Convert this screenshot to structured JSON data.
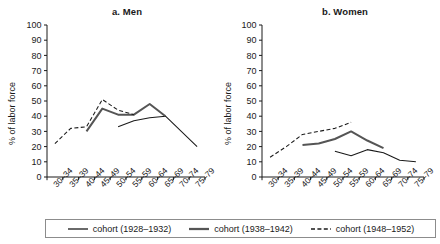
{
  "figure": {
    "ylabel": "% of labor force",
    "y_ticks": [
      "0",
      "10",
      "20",
      "30",
      "40",
      "50",
      "60",
      "70",
      "80",
      "90",
      "100"
    ],
    "x_ticks": [
      "30–34",
      "35–39",
      "40–44",
      "45–49",
      "50–54",
      "55–59",
      "60–64",
      "65–69",
      "70–74",
      "75–79"
    ],
    "panel_a_title": "a. Men",
    "panel_b_title": "b. Women",
    "colors": {
      "cohort_1928_1932": "#1a1a1a",
      "cohort_1938_1942": "#555555",
      "cohort_1948_1952": "#1a1a1a",
      "axis": "#1a1a1a",
      "legend_border": "#8c8c8c"
    },
    "legend": [
      {
        "label": "cohort (1928–1932)",
        "style": "solid-thin",
        "name": "legend-cohort-1928-1932"
      },
      {
        "label": "cohort (1938–1942)",
        "style": "solid-thick",
        "name": "legend-cohort-1938-1942"
      },
      {
        "label": "cohort (1948–1952)",
        "style": "dashed",
        "name": "legend-cohort-1948-1952"
      }
    ]
  },
  "chart_data": [
    {
      "type": "line",
      "title": "a. Men",
      "xlabel": "",
      "ylabel": "% of labor force",
      "ylim": [
        0,
        100
      ],
      "ytick_step": 10,
      "grid": false,
      "legend_position": "bottom",
      "categories": [
        "30–34",
        "35–39",
        "40–44",
        "45–49",
        "50–54",
        "55–59",
        "60–64",
        "65–69",
        "70–74",
        "75–79"
      ],
      "series": [
        {
          "name": "cohort (1928–1932)",
          "style": "solid-thin",
          "values": [
            null,
            null,
            null,
            null,
            33,
            37,
            39,
            40,
            30,
            20
          ]
        },
        {
          "name": "cohort (1938–1942)",
          "style": "solid-thick",
          "values": [
            null,
            null,
            30,
            45,
            41,
            41,
            48,
            40,
            null,
            null
          ]
        },
        {
          "name": "cohort (1948–1952)",
          "style": "dashed",
          "values": [
            22,
            32,
            33,
            51,
            44,
            41,
            null,
            null,
            null,
            null
          ]
        }
      ]
    },
    {
      "type": "line",
      "title": "b. Women",
      "xlabel": "",
      "ylabel": "% of labor force",
      "ylim": [
        0,
        100
      ],
      "ytick_step": 10,
      "grid": false,
      "legend_position": "bottom",
      "categories": [
        "30–34",
        "35–39",
        "40–44",
        "45–49",
        "50–54",
        "55–59",
        "60–64",
        "65–69",
        "70–74",
        "75–79"
      ],
      "series": [
        {
          "name": "cohort (1928–1932)",
          "style": "solid-thin",
          "values": [
            null,
            null,
            null,
            null,
            17,
            14,
            18,
            16,
            11,
            10
          ]
        },
        {
          "name": "cohort (1938–1942)",
          "style": "solid-thick",
          "values": [
            null,
            null,
            21,
            22,
            25,
            30,
            24,
            19,
            null,
            null
          ]
        },
        {
          "name": "cohort (1948–1952)",
          "style": "dashed",
          "values": [
            13,
            20,
            28,
            30,
            32,
            36,
            null,
            null,
            null,
            null
          ]
        }
      ]
    }
  ]
}
